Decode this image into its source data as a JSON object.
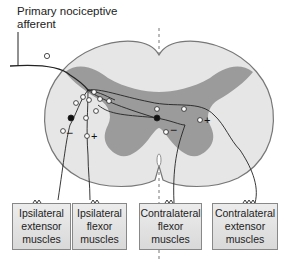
{
  "title": {
    "line1": "Primary nociceptive",
    "line2": "afferent"
  },
  "boxes": [
    {
      "line1": "Ipsilateral",
      "line2": "extensor",
      "line3": "muscles"
    },
    {
      "line1": "Ipsilateral",
      "line2": "flexor",
      "line3": "muscles"
    },
    {
      "line1": "Contralateral",
      "line2": "flexor",
      "line3": "muscles"
    },
    {
      "line1": "Contralateral",
      "line2": "extensor",
      "line3": "muscles"
    }
  ],
  "signs": {
    "minus": "−",
    "plus": "+"
  },
  "colors": {
    "white_matter": "#e6e6e6",
    "gray_matter": "#9b9b9b",
    "outline": "#777777",
    "line": "#222222"
  }
}
